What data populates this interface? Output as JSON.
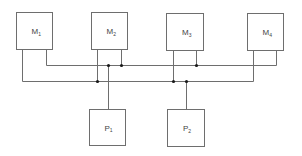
{
  "diagram": {
    "title": "",
    "colors": {
      "line": "#6e6e6e",
      "junction": "#1a1a1a",
      "text": "#444444",
      "background": "#ffffff"
    },
    "memories": [
      {
        "id": "M1",
        "label": "M",
        "sub": "1",
        "x": 16.5,
        "y": 12.5,
        "w": 36,
        "h": 37,
        "left_port_x": 22.5,
        "right_port_x": 46.5
      },
      {
        "id": "M2",
        "label": "M",
        "sub": "2",
        "x": 91.5,
        "y": 12.5,
        "w": 36,
        "h": 37,
        "left_port_x": 97.5,
        "right_port_x": 121.5
      },
      {
        "id": "M3",
        "label": "M",
        "sub": "3",
        "x": 166.5,
        "y": 13.5,
        "w": 37,
        "h": 37,
        "left_port_x": 173.5,
        "right_port_x": 196.5
      },
      {
        "id": "M4",
        "label": "M",
        "sub": "4",
        "x": 247.5,
        "y": 13.5,
        "w": 36,
        "h": 37,
        "left_port_x": 253.5,
        "right_port_x": 276.5
      }
    ],
    "processors": [
      {
        "id": "P1",
        "label": "P",
        "sub": "1",
        "x": 89.5,
        "y": 109.5,
        "w": 36,
        "h": 36,
        "port_x": 108.5,
        "bus": "upper"
      },
      {
        "id": "P2",
        "label": "P",
        "sub": "2",
        "x": 167.5,
        "y": 109.5,
        "w": 37,
        "h": 37,
        "port_x": 186.5,
        "bus": "lower"
      }
    ],
    "buses": {
      "upper": {
        "y": 65.5,
        "x1": 46.5,
        "x2": 276.5
      },
      "lower": {
        "y": 81.5,
        "x1": 22.5,
        "x2": 253.5
      }
    },
    "junctions": [
      {
        "x": 108.5,
        "y": 65.5
      },
      {
        "x": 121.5,
        "y": 65.5
      },
      {
        "x": 196.5,
        "y": 65.5
      },
      {
        "x": 97.5,
        "y": 81.5
      },
      {
        "x": 173.5,
        "y": 81.5
      },
      {
        "x": 186.5,
        "y": 81.5
      }
    ]
  }
}
